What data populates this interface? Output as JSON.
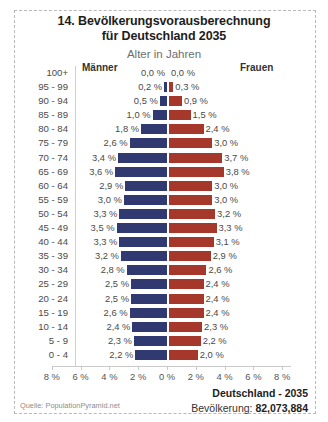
{
  "header": {
    "title_line1": "14. Bevölkerungsvorausberechnung",
    "title_line2": "für Deutschland 2035",
    "subtitle": "Alter in Jahren"
  },
  "legend": {
    "male_label": "Männer",
    "female_label": "Frauen"
  },
  "footer": {
    "country": "Deutschland - 2035",
    "population_label": "Bevölkerung:",
    "population_value": "82,073,884",
    "source": "Quelle: PopulationPyramid.net"
  },
  "colors": {
    "male": "#303a70",
    "female": "#a5382a",
    "axis": "#c9c9c9",
    "text": "#4a4a4a",
    "frame": "#b9b9b9"
  },
  "chart_data": {
    "type": "bar",
    "title": "14. Bevölkerungsvorausberechnung für Deutschland 2035",
    "subtitle": "Alter in Jahren",
    "xlabel": "",
    "ylabel": "Alter in Jahren",
    "xlim": [
      -8,
      8
    ],
    "grid": false,
    "legend_position": "top",
    "axis_ticks": [
      "8 %",
      "6 %",
      "4 %",
      "2 %",
      "0 %",
      "2 %",
      "4 %",
      "6 %",
      "8 %"
    ],
    "axis_tick_values": [
      -8,
      -6,
      -4,
      -2,
      0,
      2,
      4,
      6,
      8
    ],
    "categories": [
      "100+",
      "95 - 99",
      "90 - 94",
      "85 - 89",
      "80 - 84",
      "75 - 79",
      "70 - 74",
      "65 - 69",
      "60 - 64",
      "55 - 59",
      "50 - 54",
      "45 - 49",
      "40 - 44",
      "35 - 39",
      "30 - 34",
      "25 - 29",
      "20 - 24",
      "15 - 19",
      "10 - 14",
      "5 - 9",
      "0 - 4"
    ],
    "series": [
      {
        "name": "Männer",
        "values": [
          0.0,
          0.2,
          0.5,
          1.0,
          1.8,
          2.6,
          3.4,
          3.6,
          2.9,
          3.0,
          3.3,
          3.5,
          3.3,
          3.2,
          2.8,
          2.5,
          2.5,
          2.6,
          2.4,
          2.3,
          2.2
        ],
        "labels": [
          "0,0 %",
          "0,2 %",
          "0,5 %",
          "1,0 %",
          "1,8 %",
          "2,6 %",
          "3,4 %",
          "3,6 %",
          "2,9 %",
          "3,0 %",
          "3,3 %",
          "3,5 %",
          "3,3 %",
          "3,2 %",
          "2,8 %",
          "2,5 %",
          "2,5 %",
          "2,6 %",
          "2,4 %",
          "2,3 %",
          "2,2 %"
        ]
      },
      {
        "name": "Frauen",
        "values": [
          0.0,
          0.3,
          0.9,
          1.5,
          2.4,
          3.0,
          3.7,
          3.8,
          3.0,
          3.0,
          3.2,
          3.3,
          3.1,
          2.9,
          2.6,
          2.4,
          2.4,
          2.4,
          2.3,
          2.2,
          2.0
        ],
        "labels": [
          "0,0 %",
          "0,3 %",
          "0,9 %",
          "1,5 %",
          "2,4 %",
          "3,0 %",
          "3,7 %",
          "3,8 %",
          "3,0 %",
          "3,0 %",
          "3,2 %",
          "3,3 %",
          "3,1 %",
          "2,9 %",
          "2,6 %",
          "2,4 %",
          "2,4 %",
          "2,4 %",
          "2,3 %",
          "2,2 %",
          "2,0 %"
        ]
      }
    ]
  }
}
